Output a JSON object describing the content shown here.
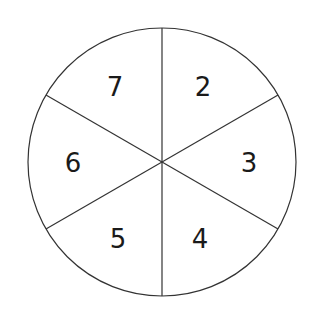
{
  "spinner": {
    "center": [
      162,
      162
    ],
    "radius": 134,
    "stroke_color": "#333333",
    "sections": [
      {
        "label": "2",
        "x": 203,
        "y": 87
      },
      {
        "label": "3",
        "x": 249,
        "y": 163
      },
      {
        "label": "4",
        "x": 200,
        "y": 239
      },
      {
        "label": "5",
        "x": 118,
        "y": 239
      },
      {
        "label": "6",
        "x": 73,
        "y": 163
      },
      {
        "label": "7",
        "x": 115,
        "y": 87
      }
    ]
  }
}
